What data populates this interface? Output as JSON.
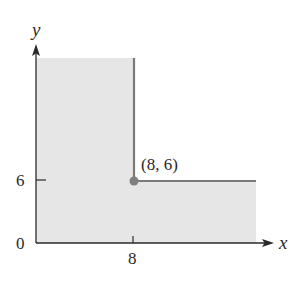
{
  "diagram": {
    "type": "region-graph",
    "axes": {
      "x_label": "x",
      "y_label": "y",
      "origin_label": "0",
      "x_ticks": [
        {
          "value": 8,
          "label": "8"
        }
      ],
      "y_ticks": [
        {
          "value": 6,
          "label": "6"
        }
      ]
    },
    "point": {
      "x": 8,
      "y": 6,
      "label": "(8, 6)"
    },
    "region": {
      "description": "Shaded L-shaped region: 0 ≤ x ≤ 8 (all y ≥ 0) together with x ≥ 8, 0 ≤ y ≤ 6",
      "fill_color": "#e6e6e6",
      "boundary_color": "#7a7a7a"
    },
    "colors": {
      "axis": "#2a2a2a",
      "boundary": "#7a7a7a",
      "point": "#7f7f7f",
      "fill": "#e6e6e6"
    }
  }
}
